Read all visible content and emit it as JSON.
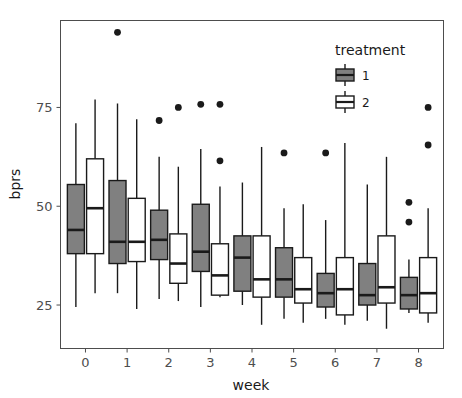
{
  "chart_data": {
    "type": "boxplot",
    "title": "",
    "xlabel": "week",
    "ylabel": "bprs",
    "xlim": [
      -0.6,
      8.6
    ],
    "ylim": [
      14,
      97
    ],
    "grid": false,
    "x_tick_labels": [
      "0",
      "1",
      "2",
      "3",
      "4",
      "5",
      "6",
      "7",
      "8"
    ],
    "y_tick_labels": [
      "25",
      "50",
      "75"
    ],
    "y_ticks": [
      25,
      50,
      75
    ],
    "categories": [
      "0",
      "1",
      "2",
      "3",
      "4",
      "5",
      "6",
      "7",
      "8"
    ],
    "legend": {
      "title": "treatment",
      "position": "top-right inside panel",
      "entries": [
        {
          "label": "1",
          "fill": "#808080",
          "stroke": "#1a1a1a"
        },
        {
          "label": "2",
          "fill": "#ffffff",
          "stroke": "#1a1a1a"
        }
      ]
    },
    "series": [
      {
        "name": "1",
        "fill": "#808080",
        "stroke": "#1a1a1a",
        "boxes": [
          {
            "week": "0",
            "min": 24.5,
            "q1": 38.0,
            "median": 44.0,
            "q3": 55.5,
            "max": 71.0,
            "outliers": []
          },
          {
            "week": "1",
            "min": 28.0,
            "q1": 35.5,
            "median": 41.0,
            "q3": 56.5,
            "max": 76.0,
            "outliers": [
              94.0
            ]
          },
          {
            "week": "2",
            "min": 26.5,
            "q1": 36.5,
            "median": 41.5,
            "q3": 49.0,
            "max": 62.5,
            "outliers": [
              71.7
            ]
          },
          {
            "week": "3",
            "min": 24.5,
            "q1": 33.5,
            "median": 38.5,
            "q3": 50.5,
            "max": 64.5,
            "outliers": [
              75.8
            ]
          },
          {
            "week": "4",
            "min": 25.0,
            "q1": 28.5,
            "median": 37.0,
            "q3": 42.5,
            "max": 56.0,
            "outliers": []
          },
          {
            "week": "5",
            "min": 21.5,
            "q1": 27.0,
            "median": 31.5,
            "q3": 39.5,
            "max": 49.5,
            "outliers": [
              63.5
            ]
          },
          {
            "week": "6",
            "min": 21.5,
            "q1": 24.5,
            "median": 28.0,
            "q3": 33.0,
            "max": 46.5,
            "outliers": [
              63.5
            ]
          },
          {
            "week": "7",
            "min": 21.0,
            "q1": 25.0,
            "median": 27.5,
            "q3": 35.5,
            "max": 55.5,
            "outliers": []
          },
          {
            "week": "8",
            "min": 23.0,
            "q1": 24.0,
            "median": 27.5,
            "q3": 32.0,
            "max": 36.5,
            "outliers": [
              51.0,
              46.0
            ]
          }
        ]
      },
      {
        "name": "2",
        "fill": "#ffffff",
        "stroke": "#1a1a1a",
        "boxes": [
          {
            "week": "0",
            "min": 28.0,
            "q1": 38.0,
            "median": 49.5,
            "q3": 62.0,
            "max": 77.0,
            "outliers": []
          },
          {
            "week": "1",
            "min": 24.0,
            "q1": 36.0,
            "median": 41.0,
            "q3": 52.0,
            "max": 72.0,
            "outliers": []
          },
          {
            "week": "2",
            "min": 26.0,
            "q1": 30.5,
            "median": 35.5,
            "q3": 43.0,
            "max": 60.0,
            "outliers": [
              75.0
            ]
          },
          {
            "week": "3",
            "min": 27.0,
            "q1": 27.5,
            "median": 32.5,
            "q3": 40.5,
            "max": 55.0,
            "outliers": [
              75.8,
              61.5
            ]
          },
          {
            "week": "4",
            "min": 20.0,
            "q1": 27.0,
            "median": 31.5,
            "q3": 42.5,
            "max": 65.0,
            "outliers": []
          },
          {
            "week": "5",
            "min": 20.5,
            "q1": 25.5,
            "median": 29.0,
            "q3": 37.0,
            "max": 50.5,
            "outliers": []
          },
          {
            "week": "6",
            "min": 20.0,
            "q1": 22.5,
            "median": 29.0,
            "q3": 37.0,
            "max": 66.0,
            "outliers": []
          },
          {
            "week": "7",
            "min": 19.0,
            "q1": 25.5,
            "median": 29.5,
            "q3": 42.5,
            "max": 62.5,
            "outliers": []
          },
          {
            "week": "8",
            "min": 20.5,
            "q1": 23.0,
            "median": 28.0,
            "q3": 37.0,
            "max": 49.5,
            "outliers": [
              75.0,
              65.5
            ]
          }
        ]
      }
    ]
  }
}
